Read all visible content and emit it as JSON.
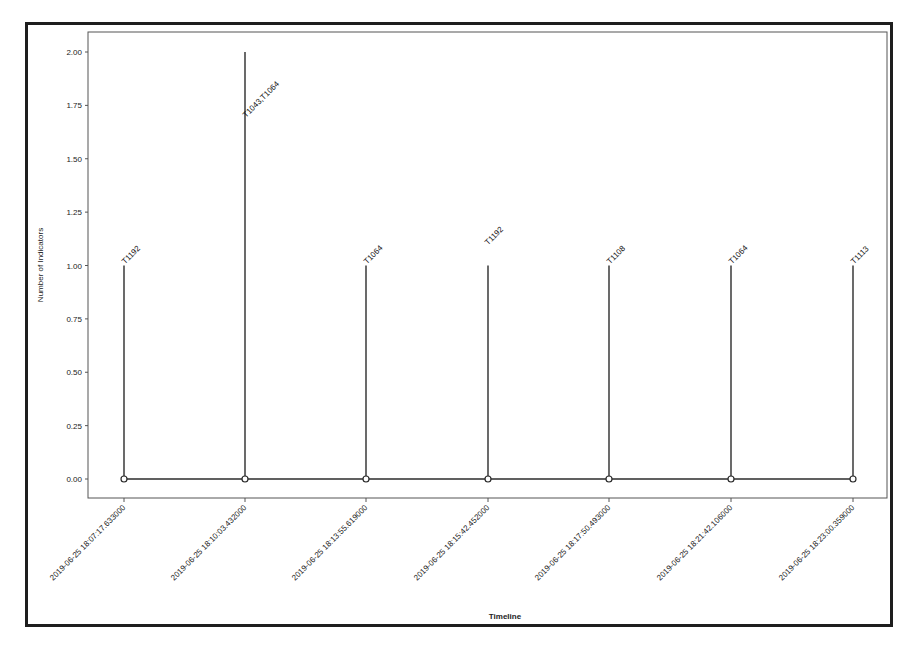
{
  "chart_data": {
    "type": "stem",
    "title": "",
    "xlabel": "Timeline",
    "ylabel": "Number of Indicators",
    "ylim": [
      -0.1,
      2.1
    ],
    "yticks": [
      "0.00",
      "0.25",
      "0.50",
      "0.75",
      "1.00",
      "1.25",
      "1.50",
      "1.75",
      "2.00"
    ],
    "grid": false,
    "legend": null,
    "categories": [
      "2019-06-25 18:07:17.633000",
      "2019-06-25 18:10:03.432000",
      "2019-06-25 18:13:55.619000",
      "2019-06-25 18:15:42.452000",
      "2019-06-25 18:17:50.493000",
      "2019-06-25 18:21:42.106000",
      "2019-06-25 18:23:00.359000"
    ],
    "values": [
      1,
      2,
      1,
      1,
      1,
      1,
      1
    ],
    "annotations": [
      "T1192",
      "T1043,T1064",
      "T1064",
      "T1192",
      "T1108",
      "T1064",
      "T1113"
    ],
    "baseline": 0,
    "colors": {
      "stem": "#2b2b2b",
      "marker_fill": "#ffffff",
      "axes": "#444444",
      "frame": "#1e1e1e"
    }
  }
}
